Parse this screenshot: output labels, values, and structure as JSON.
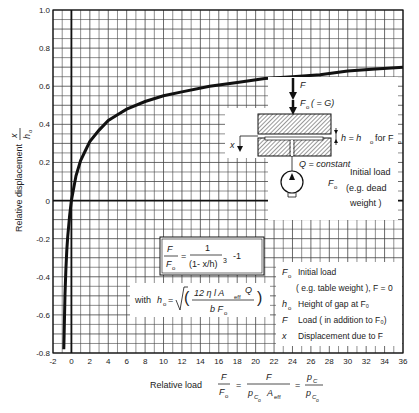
{
  "chart_data": {
    "type": "line",
    "title": "",
    "xlabel": "Relative load F/F0 = F/(pC0·Aeff) = pC/pC0",
    "ylabel": "Relative displacement x/h0",
    "xlim": [
      -2,
      36
    ],
    "ylim": [
      -0.8,
      1.0
    ],
    "x_ticks": [
      -2,
      0,
      2,
      4,
      6,
      8,
      10,
      12,
      14,
      16,
      18,
      20,
      22,
      24,
      26,
      28,
      30,
      32,
      34,
      36
    ],
    "y_ticks": [
      -0.8,
      -0.6,
      -0.4,
      -0.2,
      0,
      0.2,
      0.4,
      0.6,
      0.8,
      1.0
    ],
    "y_tick_labels": [
      "-0.8",
      "-0.6",
      "-0.4",
      "-0.2",
      "0",
      "0.2",
      "0.4",
      "0.6",
      "0.8",
      "1.0"
    ],
    "grid": true,
    "series": [
      {
        "name": "x/h0 vs F/F0",
        "formula": "F/F0 = 1/(1 - x/h)^3 - 1",
        "x": [
          -0.83,
          -0.8,
          -0.7,
          -0.6,
          -0.5,
          -0.4,
          -0.2,
          0,
          0.5,
          1,
          1.5,
          2,
          3,
          4,
          5,
          6,
          8,
          10,
          12,
          15,
          18,
          21,
          24,
          27,
          30,
          33,
          36
        ],
        "y": [
          -0.78,
          -0.71,
          -0.49,
          -0.36,
          -0.26,
          -0.19,
          -0.08,
          0.0,
          0.13,
          0.21,
          0.26,
          0.31,
          0.37,
          0.42,
          0.45,
          0.48,
          0.52,
          0.55,
          0.57,
          0.6,
          0.62,
          0.64,
          0.65,
          0.66,
          0.68,
          0.69,
          0.7
        ]
      }
    ]
  },
  "axes": {
    "ylabel_text": "Relative displacement",
    "ylabel_frac_num": "x",
    "ylabel_frac_den": "h",
    "ylabel_frac_den_sub": "o",
    "xlabel_prefix": "Relative load"
  },
  "formula_box": {
    "lhs_num": "F",
    "lhs_den": "F",
    "lhs_den_sub": "o",
    "eq": "=",
    "rhs_num": "1",
    "rhs_den": "(1- x/h)",
    "rhs_exp": "3",
    "rhs_tail": "-1"
  },
  "with_formula": {
    "prefix": "with",
    "h": "h",
    "h_sub": "o",
    "eq": "=",
    "num": "12 η l A",
    "num_sub": "eff",
    "num_tail": "Q",
    "den": "b F",
    "den_sub": "o"
  },
  "inset": {
    "F_label": "F",
    "F0_label": "F",
    "F0_sub": "o",
    "F0_tail": "( = G)",
    "h_label": "h = h",
    "h_sub": "o",
    "h_tail": "for F",
    "h_tail_sub": "o",
    "x_label": "x",
    "Q_label": "Q = constant",
    "F0_side": "F",
    "F0_side_sub": "o",
    "initial_load_1": "Initial load",
    "initial_load_2": "(e.g. dead",
    "initial_load_3": "weight )"
  },
  "legend": {
    "items": [
      {
        "symbol": "F",
        "sub": "o",
        "text": "Initial load"
      },
      {
        "symbol": "",
        "sub": "",
        "text": "( e.g. table weight ), F = 0"
      },
      {
        "symbol": "h",
        "sub": "o",
        "text": "Height of gap at F₀"
      },
      {
        "symbol": "F",
        "sub": "",
        "text": "Load ( in addition to F₀)"
      },
      {
        "symbol": "x",
        "sub": "",
        "text": "Displacement due to F"
      }
    ]
  },
  "xlabel_parts": {
    "frac1_num": "F",
    "frac1_den": "F",
    "frac1_den_sub": "o",
    "eq1": "=",
    "frac2_num": "F",
    "frac2_den": "p",
    "frac2_den_sub": "C",
    "frac2_den_subsub": "o",
    "frac2_den_tail": "A",
    "frac2_den_tail_sub": "eff",
    "eq2": "=",
    "frac3_num": "p",
    "frac3_num_sub": "C",
    "frac3_den": "p",
    "frac3_den_sub": "C",
    "frac3_den_subsub": "o"
  }
}
